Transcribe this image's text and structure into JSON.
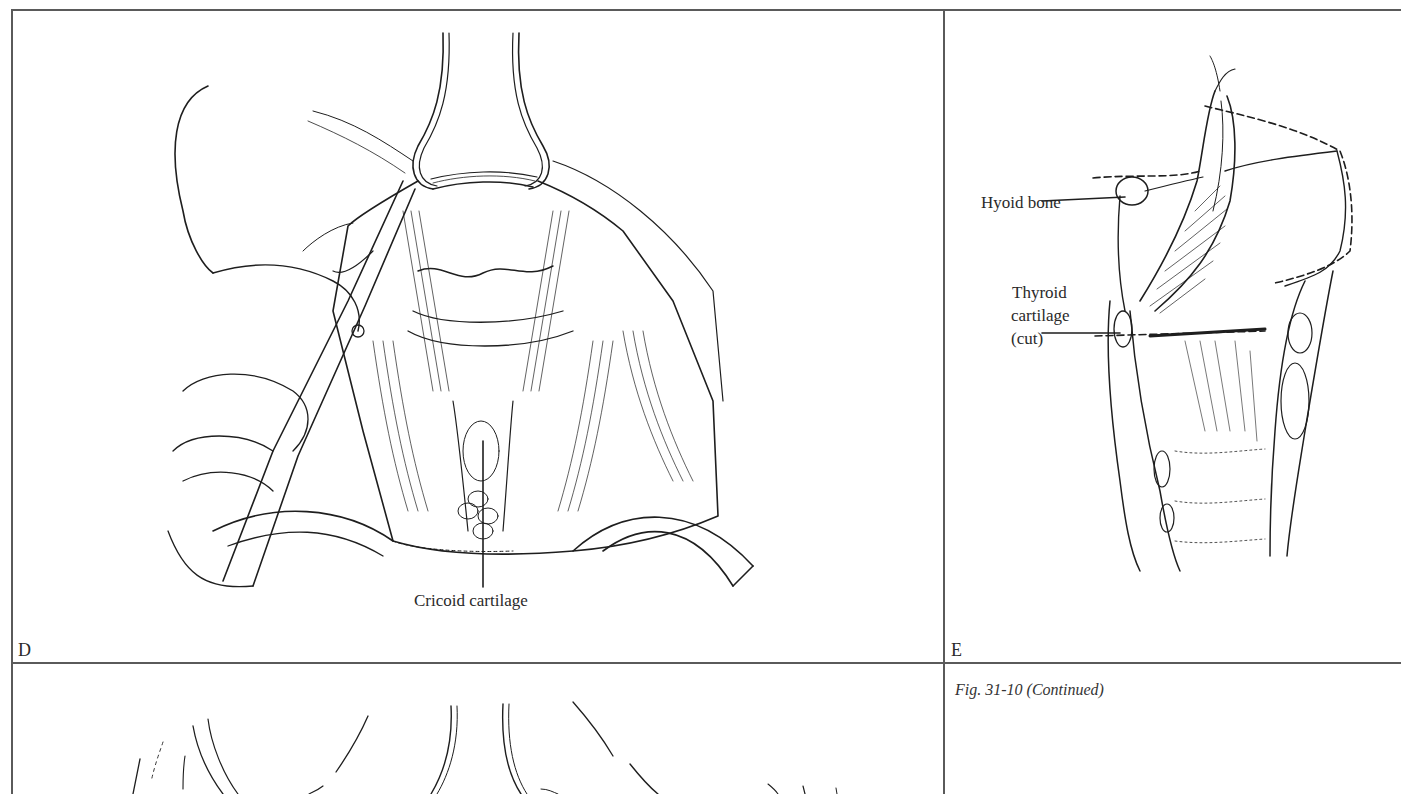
{
  "figure": {
    "caption": "Fig. 31-10 (Continued)",
    "panels": [
      {
        "id": "D",
        "letter": "D",
        "description": "Surgical view of anterior neck exposure with retractors and forceps",
        "labels": [
          {
            "text": "Cricoid cartilage"
          }
        ]
      },
      {
        "id": "E",
        "letter": "E",
        "description": "Sagittal section of larynx showing cut line",
        "labels": [
          {
            "text": "Hyoid bone"
          },
          {
            "text": "Thyroid"
          },
          {
            "text": "cartilage"
          },
          {
            "text": "(cut)"
          }
        ]
      }
    ]
  },
  "colors": {
    "frame": "#5a5a5a",
    "ink": "#1e1e1e",
    "paper": "#ffffff"
  }
}
